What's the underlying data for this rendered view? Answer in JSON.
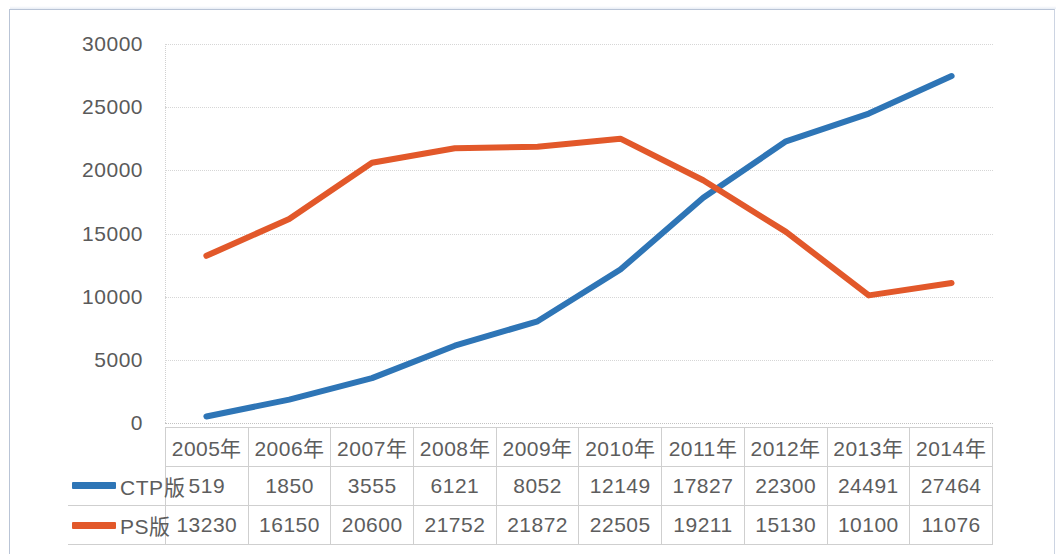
{
  "chart_data": {
    "type": "line",
    "title": "",
    "subtitle": "",
    "xlabel": "",
    "ylabel": "",
    "categories": [
      "2005年",
      "2006年",
      "2007年",
      "2008年",
      "2009年",
      "2010年",
      "2011年",
      "2012年",
      "2013年",
      "2014年"
    ],
    "series": [
      {
        "name": "CTP版",
        "color": "#2E75B6",
        "values": [
          519,
          1850,
          3555,
          6121,
          8052,
          12149,
          17827,
          22300,
          24491,
          27464
        ]
      },
      {
        "name": "PS版",
        "color": "#E2582A",
        "values": [
          13230,
          16150,
          20600,
          21752,
          21872,
          22505,
          19211,
          15130,
          10100,
          11076
        ]
      }
    ],
    "ylim": [
      0,
      30000
    ],
    "ytick_values": [
      0,
      5000,
      10000,
      15000,
      20000,
      25000,
      30000
    ],
    "ytick_labels": [
      "0",
      "5000",
      "10000",
      "15000",
      "20000",
      "25000",
      "30000"
    ],
    "grid": true,
    "legend_position": "data-table-row-headers",
    "has_data_table": true
  },
  "colors": {
    "series_ctp": "#2E75B6",
    "series_ps": "#E2582A",
    "gridline": "#d6d6d6",
    "table_border": "#cfcfcf",
    "tick_text": "#5a5a5a",
    "frame": "#b9c4d6"
  }
}
